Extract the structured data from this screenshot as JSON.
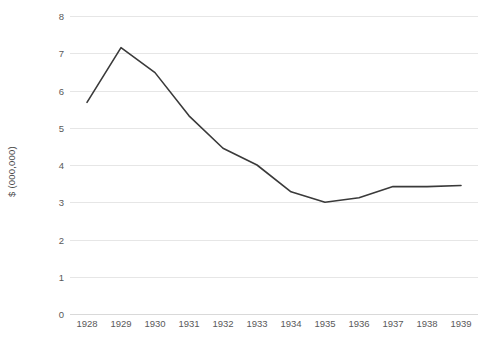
{
  "chart_data": {
    "type": "line",
    "title": "",
    "subtitle": "",
    "xlabel": "",
    "ylabel": "$ (000,000)",
    "categories": [
      "1928",
      "1929",
      "1930",
      "1931",
      "1932",
      "1933",
      "1934",
      "1935",
      "1936",
      "1937",
      "1938",
      "1939"
    ],
    "x": [
      1928,
      1929,
      1930,
      1931,
      1932,
      1933,
      1934,
      1935,
      1936,
      1937,
      1938,
      1939
    ],
    "values": [
      5.68,
      7.15,
      6.48,
      5.32,
      4.45,
      4.0,
      3.28,
      3.0,
      3.12,
      3.42,
      3.42,
      3.45
    ],
    "series": [
      {
        "name": "",
        "values": [
          5.68,
          7.15,
          6.48,
          5.32,
          4.45,
          4.0,
          3.28,
          3.0,
          3.12,
          3.42,
          3.42,
          3.45
        ],
        "color": "#3a3a3a"
      }
    ],
    "ylim": [
      0,
      8
    ],
    "yticks": [
      0,
      1,
      2,
      3,
      4,
      5,
      6,
      7,
      8
    ],
    "ytick_labels": [
      "0",
      "1",
      "2",
      "3",
      "4",
      "5",
      "6",
      "7",
      "8"
    ],
    "grid": true,
    "grid_axis": "y",
    "legend": false,
    "legend_position": "none",
    "markers": false,
    "line_width": 1.6,
    "grid_color": "#e6e6e6",
    "axis_text_color": "#595959",
    "background_color": "#ffffff"
  }
}
